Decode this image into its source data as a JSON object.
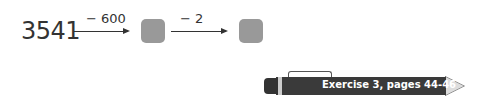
{
  "problem": {
    "start_number": "3541",
    "steps": [
      {
        "operation": "− 600"
      },
      {
        "operation": "− 2"
      }
    ]
  },
  "reference": {
    "label": "Exercise 3, pages 44-46"
  }
}
